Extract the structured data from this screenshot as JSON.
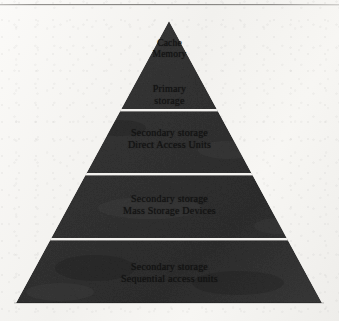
{
  "page": {
    "background_color": "#f4f3f1",
    "header_rule_color": "#8e8c89"
  },
  "diagram": {
    "type": "pyramid",
    "shape_fill_color": "#343434",
    "divider_color": "#f2f1ee",
    "label_color": "#131313",
    "apex": {
      "x": 169,
      "y": 21
    },
    "base": {
      "left_x": 16,
      "right_x": 322,
      "y": 303
    },
    "tiers": [
      {
        "index": 1,
        "name": "cache-memory",
        "lines": [
          "Cache",
          "Memory"
        ],
        "divider_below_y": null,
        "top_y": 21,
        "bottom_y": 70
      },
      {
        "index": 2,
        "name": "primary-storage",
        "lines": [
          "Primary",
          "storage"
        ],
        "divider_below_y": 110,
        "top_y": 70,
        "bottom_y": 110
      },
      {
        "index": 3,
        "name": "secondary-storage-direct-access-units",
        "lines": [
          "Secondary storage",
          "Direct Access Units"
        ],
        "divider_below_y": 174,
        "top_y": 112,
        "bottom_y": 174
      },
      {
        "index": 4,
        "name": "secondary-storage-mass-storage-devices",
        "lines": [
          "Secondary storage",
          "Mass Storage Devices"
        ],
        "divider_below_y": 239,
        "top_y": 176,
        "bottom_y": 239
      },
      {
        "index": 5,
        "name": "secondary-storage-sequential-access-units",
        "lines": [
          "Secondary storage",
          "Sequential access units"
        ],
        "divider_below_y": null,
        "top_y": 241,
        "bottom_y": 303
      }
    ]
  }
}
